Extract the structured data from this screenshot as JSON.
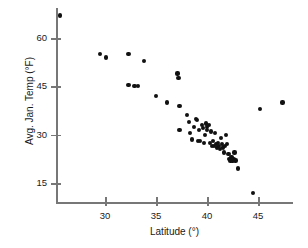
{
  "chart_data": {
    "type": "scatter",
    "title": "",
    "xlabel": "Latitude (°)",
    "ylabel": "Avg. Jan. Temp (°F)",
    "xlim": [
      25.0,
      48.2
    ],
    "ylim": [
      10.0,
      69.0
    ],
    "xticks": [
      30,
      35,
      40,
      45
    ],
    "yticks": [
      15,
      30,
      45,
      60
    ],
    "xtick_labels": [
      "30",
      "35",
      "40",
      "45"
    ],
    "ytick_labels": [
      "15",
      "30",
      "45",
      "60"
    ],
    "grid": false,
    "legend": null,
    "marker_color": "#111111",
    "axis_color": "#777777",
    "points": [
      {
        "x": 25.6,
        "y": 67.0
      },
      {
        "x": 29.5,
        "y": 55.0
      },
      {
        "x": 30.1,
        "y": 54.0
      },
      {
        "x": 32.3,
        "y": 55.0
      },
      {
        "x": 32.3,
        "y": 45.5
      },
      {
        "x": 32.9,
        "y": 45.0
      },
      {
        "x": 33.2,
        "y": 45.0
      },
      {
        "x": 33.8,
        "y": 53.0
      },
      {
        "x": 35.0,
        "y": 42.0
      },
      {
        "x": 36.1,
        "y": 40.0
      },
      {
        "x": 37.1,
        "y": 49.0
      },
      {
        "x": 37.2,
        "y": 47.5
      },
      {
        "x": 37.3,
        "y": 39.0
      },
      {
        "x": 37.3,
        "y": 31.5
      },
      {
        "x": 38.0,
        "y": 36.0
      },
      {
        "x": 38.2,
        "y": 34.0
      },
      {
        "x": 38.3,
        "y": 30.5
      },
      {
        "x": 38.5,
        "y": 28.5
      },
      {
        "x": 38.7,
        "y": 32.5
      },
      {
        "x": 38.9,
        "y": 35.0
      },
      {
        "x": 39.0,
        "y": 34.5
      },
      {
        "x": 39.1,
        "y": 28.0
      },
      {
        "x": 39.2,
        "y": 31.5
      },
      {
        "x": 39.3,
        "y": 28.0
      },
      {
        "x": 39.5,
        "y": 33.0
      },
      {
        "x": 39.6,
        "y": 32.0
      },
      {
        "x": 39.7,
        "y": 27.5
      },
      {
        "x": 39.8,
        "y": 30.0
      },
      {
        "x": 39.9,
        "y": 33.5
      },
      {
        "x": 40.0,
        "y": 32.5
      },
      {
        "x": 40.0,
        "y": 31.5
      },
      {
        "x": 40.2,
        "y": 33.0
      },
      {
        "x": 40.3,
        "y": 27.5
      },
      {
        "x": 40.4,
        "y": 31.0
      },
      {
        "x": 40.5,
        "y": 26.5
      },
      {
        "x": 40.6,
        "y": 28.0
      },
      {
        "x": 40.7,
        "y": 26.5
      },
      {
        "x": 40.8,
        "y": 30.5
      },
      {
        "x": 40.9,
        "y": 27.0
      },
      {
        "x": 41.0,
        "y": 26.0
      },
      {
        "x": 41.1,
        "y": 27.5
      },
      {
        "x": 41.2,
        "y": 26.5
      },
      {
        "x": 41.3,
        "y": 25.5
      },
      {
        "x": 41.4,
        "y": 29.0
      },
      {
        "x": 41.5,
        "y": 27.0
      },
      {
        "x": 41.6,
        "y": 26.0
      },
      {
        "x": 41.7,
        "y": 24.5
      },
      {
        "x": 41.8,
        "y": 26.5
      },
      {
        "x": 41.9,
        "y": 30.0
      },
      {
        "x": 42.0,
        "y": 27.0
      },
      {
        "x": 42.1,
        "y": 24.0
      },
      {
        "x": 42.2,
        "y": 22.5
      },
      {
        "x": 42.3,
        "y": 22.0
      },
      {
        "x": 42.4,
        "y": 23.0
      },
      {
        "x": 42.5,
        "y": 22.0
      },
      {
        "x": 42.6,
        "y": 22.5
      },
      {
        "x": 42.7,
        "y": 24.5
      },
      {
        "x": 42.8,
        "y": 22.0
      },
      {
        "x": 43.0,
        "y": 19.5
      },
      {
        "x": 44.5,
        "y": 12.0
      },
      {
        "x": 45.2,
        "y": 38.0
      },
      {
        "x": 47.4,
        "y": 40.0
      }
    ]
  },
  "plot_geometry": {
    "x_pixel_at_30": 105,
    "x_pixel_per_degree": 10.2,
    "y_pixel_at_15": 183,
    "y_pixel_per_degree": 3.22
  }
}
